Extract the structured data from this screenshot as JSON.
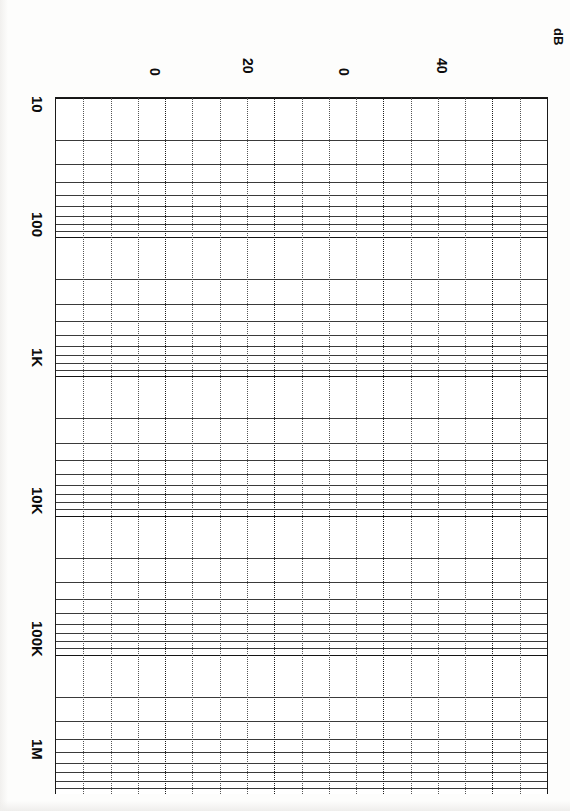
{
  "document": {
    "type": "semi-logarithmic graph paper (scanned, rotated 90 degrees)",
    "orientation_note": "All text is rotated 90 degrees clockwise"
  },
  "axes": {
    "log_axis": {
      "name": "frequency-axis",
      "scale": "log",
      "unit": "",
      "ticks": [
        {
          "label": "10",
          "value": 10
        },
        {
          "label": "100",
          "value": 100
        },
        {
          "label": "1K",
          "value": 1000
        },
        {
          "label": "10K",
          "value": 10000
        },
        {
          "label": "100K",
          "value": 100000
        },
        {
          "label": "1M",
          "value": 1000000
        }
      ]
    },
    "linear_axis": {
      "name": "amplitude-axis",
      "scale": "linear",
      "unit_label": "dB",
      "ticks": [
        {
          "label": "0",
          "value": 0
        },
        {
          "label": "20",
          "value": 20
        },
        {
          "label": "0",
          "value": 30
        },
        {
          "label": "40",
          "value": 40
        }
      ]
    }
  },
  "chart_data": {
    "type": "line",
    "title": "",
    "subtitle": "",
    "xlabel": "dB",
    "ylabel": "",
    "grid": true,
    "legend": null,
    "series": [],
    "x": [
      0,
      20,
      30,
      40
    ],
    "xtick_labels": [
      "0",
      "20",
      "0",
      "40"
    ],
    "xlim": [
      -10,
      50
    ],
    "ylog": true,
    "ytick_labels": [
      "10",
      "100",
      "1K",
      "10K",
      "100K",
      "1M"
    ],
    "ytick_values": [
      10,
      100,
      1000,
      10000,
      100000,
      1000000
    ],
    "ylim": [
      10,
      1000000
    ],
    "annotations": [
      {
        "text": "dB",
        "position": "top-right"
      }
    ],
    "note": "Blank semi-log grid sheet: logarithmic decade axis 10 to 1M, linear dB axis 0 to 40+. No plotted data curves are present."
  },
  "colors": {
    "paper": "#fdfdfc",
    "grid_major": "#141414",
    "grid_minor": "#3a3a3a",
    "grid_dotted": "#555555",
    "text": "#0c0c0c"
  }
}
